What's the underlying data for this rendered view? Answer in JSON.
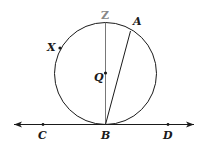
{
  "diagram": {
    "type": "geometry",
    "colors": {
      "stroke": "#1a1a1a",
      "z_label": "#888888",
      "background": "#ffffff"
    },
    "circle": {
      "center_label": "Q",
      "cx": 105.5,
      "cy": 73.5,
      "r": 51
    },
    "points": [
      {
        "label": "Z",
        "x": 105,
        "y": 23
      },
      {
        "label": "A",
        "x": 130,
        "y": 31
      },
      {
        "label": "X",
        "x": 60,
        "y": 48
      },
      {
        "label": "Q",
        "x": 105,
        "y": 73
      },
      {
        "label": "B",
        "x": 105,
        "y": 124
      },
      {
        "label": "C",
        "x": 43,
        "y": 124
      },
      {
        "label": "D",
        "x": 168,
        "y": 124
      }
    ],
    "segments": [
      {
        "from": "Z",
        "to": "B"
      },
      {
        "from": "A",
        "to": "B"
      }
    ],
    "line": {
      "through": [
        "C",
        "D"
      ],
      "arrows": "both",
      "tangent_at": "B"
    },
    "labels": {
      "Z": "Z",
      "A": "A",
      "X": "X",
      "Q": "Q",
      "B": "B",
      "C": "C",
      "D": "D"
    }
  }
}
